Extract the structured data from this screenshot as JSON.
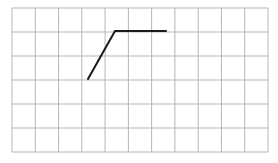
{
  "diagram": {
    "type": "grid-drawing",
    "grid": {
      "columns": 11,
      "rows": 6,
      "left": 12,
      "top": 8,
      "right": 268,
      "bottom": 152,
      "line_color": "#b5b5b5"
    },
    "polyline": {
      "color": "#1a1a1a",
      "width": 2,
      "points_px": [
        [
          88,
          79
        ],
        [
          115,
          31
        ],
        [
          166,
          31
        ]
      ],
      "points_grid": [
        [
          3.25,
          3
        ],
        [
          4.4,
          1
        ],
        [
          6.6,
          1
        ]
      ]
    }
  }
}
